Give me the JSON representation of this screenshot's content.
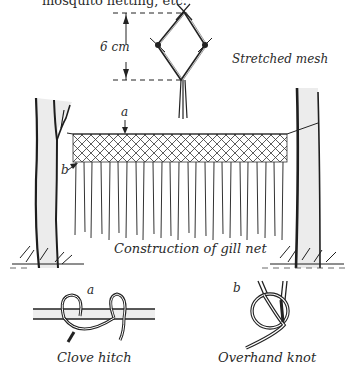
{
  "intro_text": "mosquito netting, etc.",
  "stretched_mesh": {
    "measurement": "6 cm",
    "caption": "Stretched mesh"
  },
  "gill_net": {
    "label_a": "a",
    "label_b": "b",
    "caption": "Construction of gill net"
  },
  "clove_hitch": {
    "label": "a",
    "caption": "Clove hitch"
  },
  "overhand_knot": {
    "label": "b",
    "caption": "Overhand knot"
  },
  "colors": {
    "ink": "#1e1e1e",
    "bark_shade": "#e6e6e6",
    "background": "#ffffff"
  }
}
